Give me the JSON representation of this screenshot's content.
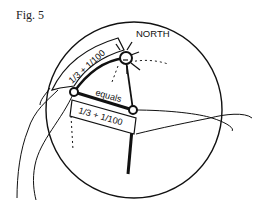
{
  "figure": {
    "label": "Fig. 5"
  },
  "diagram": {
    "north_label": "NORTH",
    "upper_band_label": "1/3 + 1/100",
    "middle_label": "equals",
    "lower_band_label": "1/3 + 1/100"
  },
  "colors": {
    "ink": "#111111",
    "background": "#ffffff"
  }
}
